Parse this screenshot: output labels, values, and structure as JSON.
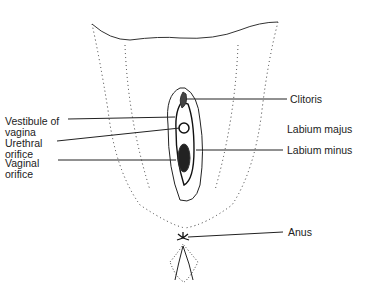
{
  "diagram": {
    "type": "anatomical-illustration",
    "labels_left": [
      {
        "id": "vestibule",
        "text": "Vestibule of\nvagina"
      },
      {
        "id": "urethral",
        "text": "Urethral\norifice"
      },
      {
        "id": "vaginal",
        "text": "Vaginal\norifice"
      }
    ],
    "labels_right": [
      {
        "id": "clitoris",
        "text": "Clitoris"
      },
      {
        "id": "labium-majus",
        "text": "Labium majus"
      },
      {
        "id": "labium-minus",
        "text": "Labium minus"
      },
      {
        "id": "anus",
        "text": "Anus"
      }
    ],
    "colors": {
      "ink": "#222222",
      "background": "#ffffff"
    }
  }
}
